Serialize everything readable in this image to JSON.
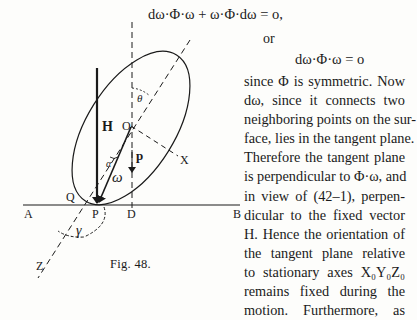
{
  "equations": {
    "eq1": "dω·Φ·ω + ω·Φ·dω = o,",
    "or": "or",
    "eq2": "dω·Φ·ω = o"
  },
  "paragraph": {
    "lines": [
      "since Φ is symmetric.  Now",
      "dω, since it connects two",
      "neighboring points on the sur-",
      "face, lies in the tangent plane.",
      "Therefore the tangent plane",
      "is perpendicular to Φ·ω, and",
      "in view of (42–1), perpen-",
      "dicular to the fixed vector",
      "H.  Hence the orientation of",
      "the tangent plane relative",
      "to stationary axes X₀Y₀Z₀",
      "remains fixed during the",
      "motion.  Furthermore, as"
    ]
  },
  "figure": {
    "caption": "Fig. 48.",
    "labels": {
      "H": "H",
      "O": "O",
      "p": "p",
      "omega": "ω",
      "alpha": "α",
      "theta": "θ",
      "gamma": "γ",
      "X": "X",
      "Z": "Z",
      "Q": "Q",
      "P": "P",
      "D": "D",
      "A": "A",
      "B": "B"
    }
  }
}
